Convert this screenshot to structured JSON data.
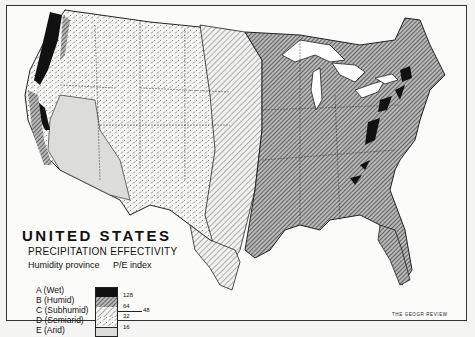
{
  "map": {
    "title": "UNITED STATES",
    "subtitle": "PRECIPITATION EFFECTIVITY",
    "legend": {
      "column_headers": [
        "Humidity province",
        "P/E index"
      ],
      "provinces": [
        {
          "code": "A",
          "label": "A (Wet)",
          "fill": "solid-black"
        },
        {
          "code": "B",
          "label": "B (Humid)",
          "fill": "dense-diagonal-hatch"
        },
        {
          "code": "C",
          "label": "C (Subhumid)",
          "fill": "sparse-diagonal-hatch"
        },
        {
          "code": "D",
          "label": "D (Semiarid)",
          "fill": "dash-pattern"
        },
        {
          "code": "E",
          "label": "E (Arid)",
          "fill": "stipple"
        }
      ],
      "index_ticks": [
        "128",
        "64",
        "48",
        "32",
        "16"
      ]
    },
    "credit": "THE GEOGR REVIEW",
    "colors": {
      "ink": "#111111",
      "paper": "#fbfbf9",
      "water": "#ffffff"
    }
  }
}
